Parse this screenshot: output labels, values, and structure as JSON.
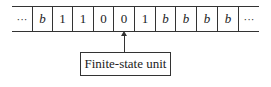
{
  "diagram": {
    "type": "turing-machine-tape",
    "tape": {
      "cells": [
        {
          "symbol": "···",
          "kind": "ellipsis"
        },
        {
          "symbol": "b",
          "kind": "blank"
        },
        {
          "symbol": "1",
          "kind": "digit"
        },
        {
          "symbol": "1",
          "kind": "digit"
        },
        {
          "symbol": "0",
          "kind": "digit"
        },
        {
          "symbol": "0",
          "kind": "digit"
        },
        {
          "symbol": "1",
          "kind": "digit"
        },
        {
          "symbol": "b",
          "kind": "blank"
        },
        {
          "symbol": "b",
          "kind": "blank"
        },
        {
          "symbol": "b",
          "kind": "blank"
        },
        {
          "symbol": "b",
          "kind": "blank"
        },
        {
          "symbol": "···",
          "kind": "ellipsis"
        }
      ],
      "head_position_index": 5
    },
    "control": {
      "label": "Finite-state unit"
    }
  }
}
